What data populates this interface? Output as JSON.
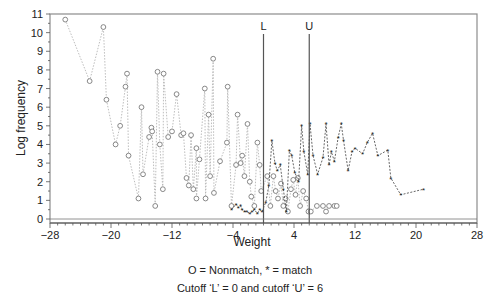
{
  "chart_data": {
    "type": "scatter",
    "title": "",
    "xlabel": "Weight",
    "ylabel": "Log frequency",
    "xlim": [
      -28,
      28
    ],
    "ylim": [
      0,
      11
    ],
    "x_ticks": [
      -28,
      -20,
      -12,
      -4,
      4,
      12,
      20,
      28
    ],
    "x_tick_labels": [
      "−28",
      "−20",
      "−12",
      "−4",
      "4",
      "12",
      "20",
      "28"
    ],
    "y_ticks": [
      0,
      1,
      2,
      3,
      4,
      5,
      6,
      7,
      8,
      9,
      10,
      11
    ],
    "grid": false,
    "cutoffs": [
      {
        "name": "L",
        "label": "L",
        "x": 0
      },
      {
        "name": "U",
        "label": "U",
        "x": 6
      }
    ],
    "legend_text": "O = Nonmatch, * = match",
    "cutoff_text": "Cutoff ‘L’ = 0 and cutoff ‘U’ = 6",
    "series": [
      {
        "name": "Nonmatch",
        "marker": "O",
        "line": "dotted",
        "color": "#9a9a9a",
        "points": [
          [
            -26.0,
            10.7
          ],
          [
            -22.8,
            7.4
          ],
          [
            -21.0,
            10.3
          ],
          [
            -20.6,
            6.4
          ],
          [
            -19.4,
            4.0
          ],
          [
            -18.8,
            5.0
          ],
          [
            -18.1,
            7.1
          ],
          [
            -17.9,
            7.8
          ],
          [
            -17.7,
            3.4
          ],
          [
            -16.4,
            1.1
          ],
          [
            -16.0,
            6.0
          ],
          [
            -15.8,
            2.4
          ],
          [
            -15.0,
            4.4
          ],
          [
            -14.7,
            4.9
          ],
          [
            -14.6,
            4.7
          ],
          [
            -14.2,
            0.7
          ],
          [
            -13.9,
            7.9
          ],
          [
            -13.6,
            4.0
          ],
          [
            -13.2,
            1.6
          ],
          [
            -13.1,
            7.8
          ],
          [
            -12.5,
            4.4
          ],
          [
            -12.0,
            4.7
          ],
          [
            -11.4,
            6.7
          ],
          [
            -10.8,
            4.5
          ],
          [
            -10.5,
            4.6
          ],
          [
            -10.1,
            2.2
          ],
          [
            -9.8,
            1.8
          ],
          [
            -9.5,
            4.5
          ],
          [
            -9.2,
            1.6
          ],
          [
            -8.8,
            3.8
          ],
          [
            -8.4,
            3.2
          ],
          [
            -8.8,
            1.1
          ],
          [
            -7.7,
            7.0
          ],
          [
            -7.6,
            1.1
          ],
          [
            -7.2,
            5.6
          ],
          [
            -7.0,
            2.3
          ],
          [
            -6.6,
            8.6
          ],
          [
            -6.5,
            1.4
          ],
          [
            -5.7,
            3.1
          ],
          [
            -4.8,
            4.1
          ],
          [
            -4.7,
            7.1
          ],
          [
            -4.2,
            0.7
          ],
          [
            -3.6,
            2.9
          ],
          [
            -3.4,
            5.6
          ],
          [
            -3.0,
            3.0
          ],
          [
            -2.8,
            3.4
          ],
          [
            -2.5,
            2.3
          ],
          [
            -2.1,
            5.1
          ],
          [
            -1.8,
            2.0
          ],
          [
            -1.6,
            1.2
          ],
          [
            -1.2,
            0.7
          ],
          [
            -0.8,
            4.1
          ],
          [
            -0.5,
            2.9
          ],
          [
            -0.3,
            1.5
          ],
          [
            0.5,
            2.3
          ],
          [
            0.9,
            0.7
          ],
          [
            1.3,
            2.3
          ],
          [
            1.6,
            1.5
          ],
          [
            1.9,
            1.1
          ],
          [
            2.3,
            1.9
          ],
          [
            2.6,
            0.7
          ],
          [
            2.9,
            1.1
          ],
          [
            3.2,
            0.4
          ],
          [
            3.6,
            1.6
          ],
          [
            3.9,
            2.1
          ],
          [
            4.2,
            1.3
          ],
          [
            4.5,
            2.2
          ],
          [
            4.8,
            0.7
          ],
          [
            5.2,
            1.5
          ],
          [
            5.6,
            1.1
          ],
          [
            5.9,
            0.4
          ],
          [
            6.2,
            0.4
          ],
          [
            7.0,
            0.7
          ],
          [
            7.8,
            0.7
          ],
          [
            8.2,
            0.4
          ],
          [
            8.6,
            0.7
          ],
          [
            9.3,
            0.7
          ],
          [
            9.6,
            0.7
          ]
        ]
      },
      {
        "name": "Match",
        "marker": "*",
        "line": "dashed",
        "color": "#333333",
        "points": [
          [
            -4.2,
            0.5
          ],
          [
            -3.6,
            0.8
          ],
          [
            -3.3,
            0.6
          ],
          [
            -3.0,
            0.7
          ],
          [
            -2.8,
            0.5
          ],
          [
            -2.5,
            0.4
          ],
          [
            -2.2,
            0.4
          ],
          [
            -1.8,
            0.3
          ],
          [
            -1.5,
            0.4
          ],
          [
            -1.2,
            0.5
          ],
          [
            -0.8,
            0.3
          ],
          [
            -0.5,
            0.5
          ],
          [
            -0.2,
            0.4
          ],
          [
            0.3,
            0.9
          ],
          [
            0.7,
            1.8
          ],
          [
            1.1,
            4.2
          ],
          [
            1.5,
            3.0
          ],
          [
            1.8,
            2.6
          ],
          [
            2.2,
            2.9
          ],
          [
            2.6,
            1.6
          ],
          [
            3.0,
            0.4
          ],
          [
            3.4,
            3.7
          ],
          [
            3.7,
            3.4
          ],
          [
            4.1,
            2.5
          ],
          [
            4.6,
            2.0
          ],
          [
            5.0,
            5.0
          ],
          [
            5.3,
            3.6
          ],
          [
            5.8,
            2.4
          ],
          [
            6.1,
            5.1
          ],
          [
            6.5,
            3.4
          ],
          [
            7.1,
            2.4
          ],
          [
            7.8,
            3.3
          ],
          [
            8.2,
            5.1
          ],
          [
            8.6,
            2.9
          ],
          [
            8.9,
            3.6
          ],
          [
            9.3,
            3.1
          ],
          [
            9.8,
            4.4
          ],
          [
            10.2,
            5.1
          ],
          [
            10.5,
            4.2
          ],
          [
            11.1,
            2.6
          ],
          [
            11.6,
            3.6
          ],
          [
            12.0,
            3.8
          ],
          [
            13.0,
            3.5
          ],
          [
            13.6,
            4.1
          ],
          [
            14.3,
            4.6
          ],
          [
            15.0,
            3.4
          ],
          [
            16.3,
            3.7
          ],
          [
            16.7,
            2.2
          ],
          [
            18.0,
            1.3
          ],
          [
            21.0,
            1.6
          ]
        ]
      }
    ]
  }
}
